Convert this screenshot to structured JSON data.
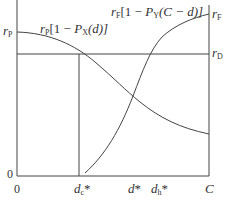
{
  "diagram": {
    "curves": {
      "left_curve_label": {
        "r": "r",
        "sub": "P",
        "rest": "[1 − ",
        "P": "P",
        "Psub": "X",
        "arg": "(d)]"
      },
      "right_curve_label": {
        "r": "r",
        "sub": "F",
        "rest": "[1 − ",
        "P": "P",
        "Psub": "Y",
        "arg": "(C − d)]"
      }
    },
    "y_axis_left": {
      "rP": {
        "r": "r",
        "sub": "P"
      },
      "zero": "0"
    },
    "y_axis_right": {
      "rF": {
        "r": "r",
        "sub": "F"
      },
      "rD": {
        "r": "r",
        "sub": "D"
      }
    },
    "x_axis": {
      "zero": "0",
      "dc": {
        "d": "d",
        "sub": "c",
        "star": "*"
      },
      "dstar": {
        "d": "d",
        "star": "*"
      },
      "dh": {
        "d": "d",
        "sub": "h",
        "star": "*"
      },
      "C": "C"
    },
    "colors": {
      "line": "#444444",
      "text": "#333333"
    }
  }
}
